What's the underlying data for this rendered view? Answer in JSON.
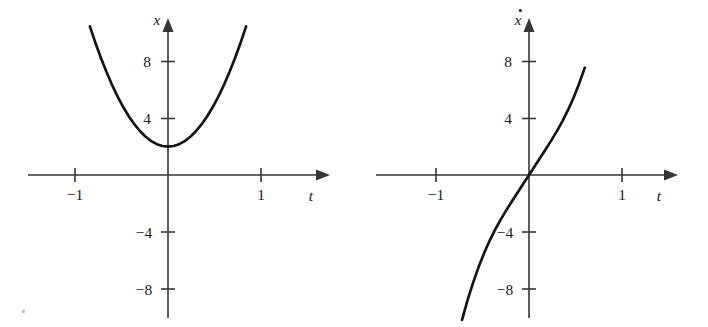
{
  "figure": {
    "background_color": "#ffffff",
    "curve_color": "#141414",
    "axis_color": "#363636",
    "speck_artifact": {
      "present": true,
      "x": 22,
      "y": 310
    }
  },
  "plots": [
    {
      "id": "position-plot",
      "y_axis_label": "x",
      "y_axis_label_style": "italic",
      "x_axis_label": "t",
      "x_axis_label_style": "italic",
      "x_ticks": [
        {
          "value": -1,
          "label": "−1"
        },
        {
          "value": 1,
          "label": "1"
        }
      ],
      "y_ticks": [
        {
          "value": 8,
          "label": "8"
        },
        {
          "value": 4,
          "label": "4"
        },
        {
          "value": -4,
          "label": "−4"
        },
        {
          "value": -8,
          "label": "−8"
        }
      ],
      "xlim": [
        -1.5,
        1.6
      ],
      "ylim": [
        -10.6,
        10.5
      ],
      "grid": false,
      "legend": false
    },
    {
      "id": "velocity-plot",
      "y_axis_label": "ẋ",
      "y_axis_label_base": "x",
      "y_axis_label_accent": "dot-above",
      "y_axis_label_style": "italic",
      "x_axis_label": "t",
      "x_axis_label_style": "italic",
      "x_ticks": [
        {
          "value": -1,
          "label": "−1"
        },
        {
          "value": 1,
          "label": "1"
        }
      ],
      "y_ticks": [
        {
          "value": 8,
          "label": "8"
        },
        {
          "value": 4,
          "label": "4"
        },
        {
          "value": -4,
          "label": "−4"
        },
        {
          "value": -8,
          "label": "−8"
        }
      ],
      "xlim": [
        -1.5,
        1.6
      ],
      "ylim": [
        -10.6,
        10.5
      ],
      "grid": false,
      "legend": false
    }
  ],
  "chart_data": [
    {
      "type": "line",
      "id": "position-plot",
      "title": "",
      "xlabel": "t",
      "ylabel": "x",
      "equation": "x = 2 + 12t^2",
      "xlim": [
        -1.5,
        1.6
      ],
      "ylim": [
        -10.6,
        10.5
      ],
      "xticks": [
        -1,
        1
      ],
      "xticklabels": [
        "−1",
        "1"
      ],
      "yticks": [
        -8,
        -4,
        4,
        8
      ],
      "yticklabels": [
        "−8",
        "−4",
        "4",
        "8"
      ],
      "grid": false,
      "legend": false,
      "series": [
        {
          "name": "x(t)",
          "x": [
            -0.84,
            -0.78,
            -0.72,
            -0.66,
            -0.6,
            -0.54,
            -0.48,
            -0.42,
            -0.36,
            -0.3,
            -0.24,
            -0.18,
            -0.12,
            -0.06,
            0.0,
            0.06,
            0.12,
            0.18,
            0.24,
            0.3,
            0.36,
            0.42,
            0.48,
            0.54,
            0.6,
            0.66,
            0.72,
            0.78,
            0.84
          ],
          "y": [
            10.47,
            9.3,
            8.22,
            7.23,
            6.32,
            5.5,
            4.77,
            4.12,
            3.56,
            3.08,
            2.69,
            2.39,
            2.17,
            2.04,
            2.0,
            2.04,
            2.17,
            2.39,
            2.69,
            3.08,
            3.56,
            4.12,
            4.77,
            5.5,
            6.32,
            7.23,
            8.22,
            9.3,
            10.47
          ]
        }
      ]
    },
    {
      "type": "line",
      "id": "velocity-plot",
      "title": "",
      "xlabel": "t",
      "ylabel": "ẋ",
      "equation": "xdot = 24t (drawn with cubic curvature)",
      "xlim": [
        -1.5,
        1.6
      ],
      "ylim": [
        -10.6,
        10.5
      ],
      "xticks": [
        -1,
        1
      ],
      "xticklabels": [
        "−1",
        "1"
      ],
      "yticks": [
        -8,
        -4,
        4,
        8
      ],
      "yticklabels": [
        "−8",
        "−4",
        "4",
        "8"
      ],
      "grid": false,
      "legend": false,
      "series": [
        {
          "name": "xdot(t)",
          "x": [
            -0.72,
            -0.66,
            -0.6,
            -0.54,
            -0.48,
            -0.42,
            -0.36,
            -0.3,
            -0.24,
            -0.18,
            -0.12,
            -0.06,
            0.0,
            0.06,
            0.12,
            0.18,
            0.24,
            0.3,
            0.36,
            0.42,
            0.48,
            0.54,
            0.6
          ],
          "y": [
            -10.2,
            -8.8,
            -7.56,
            -6.45,
            -5.46,
            -4.58,
            -3.8,
            -3.09,
            -2.44,
            -1.82,
            -1.21,
            -0.6,
            0.0,
            0.6,
            1.21,
            1.82,
            2.44,
            3.09,
            3.8,
            4.58,
            5.46,
            6.45,
            7.56
          ]
        }
      ]
    }
  ]
}
